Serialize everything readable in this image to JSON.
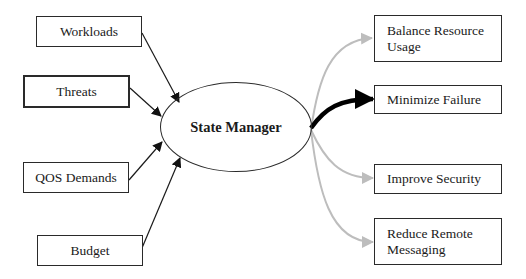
{
  "diagram": {
    "hub": {
      "label": "State Manager"
    },
    "inputs": [
      {
        "label": "Workloads"
      },
      {
        "label": "Threats"
      },
      {
        "label": "QOS Demands"
      },
      {
        "label": "Budget"
      }
    ],
    "outputs": [
      {
        "label": "Balance Resource\nUsage",
        "emphasis": "light"
      },
      {
        "label": "Minimize Failure",
        "emphasis": "strong"
      },
      {
        "label": "Improve Security",
        "emphasis": "light"
      },
      {
        "label": "Reduce Remote\nMessaging",
        "emphasis": "light"
      }
    ],
    "colors": {
      "line": "#1a1a1a",
      "light_arrow": "#bdbdbd",
      "strong_arrow": "#000000"
    }
  }
}
